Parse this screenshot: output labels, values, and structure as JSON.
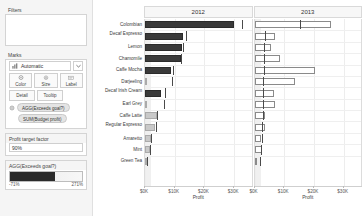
{
  "sidebar": {
    "filters": {
      "title": "Filters"
    },
    "marks": {
      "title": "Marks",
      "type_label": "Automatic",
      "type_icon": "bar-chart-icon",
      "dropdown_icon": "chevron-down-icon",
      "buttons": [
        {
          "label": "Color",
          "icon": "color-palette-icon"
        },
        {
          "label": "Size",
          "icon": "size-icon"
        },
        {
          "label": "Label",
          "icon": "label-icon"
        }
      ],
      "buttons2": [
        {
          "label": "Detail",
          "icon": "detail-icon"
        },
        {
          "label": "Tooltip",
          "icon": "tooltip-icon"
        }
      ],
      "pills": [
        {
          "label": "AGG(Exceeds goal?)",
          "icon": "color-palette-icon"
        },
        {
          "label": "SUM(Budget profit)",
          "icon": ""
        }
      ]
    },
    "parameter": {
      "title": "Profit target factor",
      "value": "90%"
    },
    "legend": {
      "title": "AGG(Exceeds goal?)",
      "min_label": "-71%",
      "max_label": "271%",
      "dark_color": "#2b2b2b",
      "light_color": "#f5f5f5"
    }
  },
  "chart_data": {
    "type": "bar",
    "title": "",
    "xlabel": "Profit",
    "ylabel": "",
    "panel_headers": [
      "2012",
      "2013"
    ],
    "categories": [
      "Colombian",
      "Decaf Espresso",
      "Lemon",
      "Chamomile",
      "Caffe Mocha",
      "Darjeeling",
      "Decaf Irish Cream",
      "Earl Grey",
      "Caffe Latte",
      "Regular Espresso",
      "Amaretto",
      "Mint",
      "Green Tea"
    ],
    "xticks_2012": [
      "$0K",
      "$10K",
      "$20K",
      "$30K"
    ],
    "xticks_2013": [
      "$0K",
      "$10K",
      "$20K",
      "$30K"
    ],
    "xlim": [
      0,
      36000
    ],
    "grid": true,
    "legend_position": "sidebar",
    "series": [
      {
        "name": "2012 Profit",
        "values": [
          30100,
          12700,
          12400,
          12200,
          8700,
          0,
          5300,
          0,
          3900,
          3500,
          1900,
          1700,
          400
        ]
      },
      {
        "name": "2012 Budget profit",
        "values": [
          32500,
          13900,
          12900,
          12100,
          9500,
          9100,
          6800,
          6400,
          4200,
          3800,
          2100,
          1800,
          600
        ]
      },
      {
        "name": "2013 Profit",
        "values": [
          25700,
          6900,
          5500,
          8700,
          20500,
          13500,
          6700,
          6900,
          3500,
          3600,
          2200,
          2400,
          300
        ]
      },
      {
        "name": "2013 Budget profit",
        "values": [
          15200,
          3400,
          3300,
          3200,
          3100,
          3000,
          2900,
          2800,
          2700,
          2600,
          2400,
          2200,
          2000
        ]
      }
    ]
  }
}
